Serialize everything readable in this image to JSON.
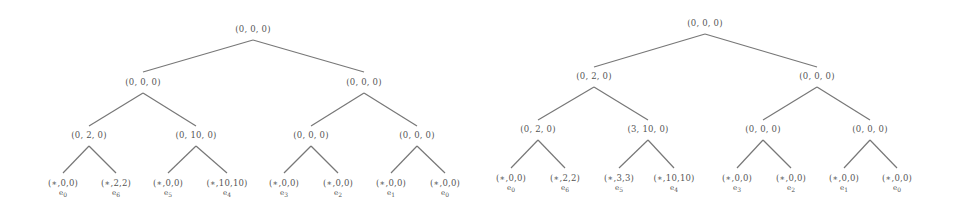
{
  "trees": [
    {
      "name": "left-tree",
      "root": "(0, 0, 0)",
      "level1": [
        "(0, 0, 0)",
        "(0, 0, 0)"
      ],
      "level2": [
        "(0, 2, 0)",
        "(0, 10, 0)",
        "(0, 0, 0)",
        "(0, 0, 0)"
      ],
      "leaves": [
        "(∗,0,0)",
        "(∗,2,2)",
        "(∗,0,0)",
        "(∗,10,10)",
        "(∗,0,0)",
        "(∗,0,0)",
        "(∗,0,0)",
        "(∗,0,0)"
      ],
      "leaf_labels": [
        {
          "e": "e",
          "i": "0"
        },
        {
          "e": "e",
          "i": "6"
        },
        {
          "e": "e",
          "i": "5"
        },
        {
          "e": "e",
          "i": "4"
        },
        {
          "e": "e",
          "i": "3"
        },
        {
          "e": "e",
          "i": "2"
        },
        {
          "e": "e",
          "i": "1"
        },
        {
          "e": "e",
          "i": "0"
        }
      ]
    },
    {
      "name": "right-tree",
      "root": "(0, 0, 0)",
      "level1": [
        "(0, 2, 0)",
        "(0, 0, 0)"
      ],
      "level2": [
        "(0, 2, 0)",
        "(3, 10, 0)",
        "(0, 0, 0)",
        "(0, 0, 0)"
      ],
      "leaves": [
        "(∗,0,0)",
        "(∗,2,2)",
        "(∗,3,3)",
        "(∗,10,10)",
        "(∗,0,0)",
        "(∗,0,0)",
        "(∗,0,0)",
        "(∗,0,0)"
      ],
      "leaf_labels": [
        {
          "e": "e",
          "i": "0"
        },
        {
          "e": "e",
          "i": "6"
        },
        {
          "e": "e",
          "i": "5"
        },
        {
          "e": "e",
          "i": "4"
        },
        {
          "e": "e",
          "i": "3"
        },
        {
          "e": "e",
          "i": "2"
        },
        {
          "e": "e",
          "i": "1"
        },
        {
          "e": "e",
          "i": "0"
        }
      ]
    }
  ]
}
